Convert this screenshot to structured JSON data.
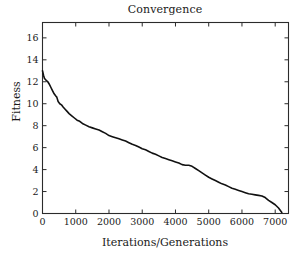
{
  "chart_data": {
    "type": "line",
    "title": "Convergence",
    "xlabel": "Iterations/Generations",
    "ylabel": "Fitness",
    "xlim": [
      0,
      7400
    ],
    "ylim": [
      0,
      17.4
    ],
    "grid": false,
    "legend": null,
    "xticks": [
      0,
      1000,
      2000,
      3000,
      4000,
      5000,
      6000,
      7000
    ],
    "xticklabels": [
      "0",
      "1000",
      "2000",
      "3000",
      "4000",
      "5000",
      "6000",
      "7000"
    ],
    "yticks": [
      0,
      2,
      4,
      6,
      8,
      10,
      12,
      14,
      16
    ],
    "yticklabels": [
      "0",
      "2",
      "4",
      "6",
      "8",
      "10",
      "12",
      "14",
      "16"
    ],
    "line_color": "#111111",
    "series": [
      {
        "name": "Best fitness",
        "x": [
          0,
          30,
          60,
          90,
          120,
          160,
          200,
          250,
          300,
          350,
          400,
          430,
          470,
          520,
          570,
          620,
          680,
          740,
          800,
          880,
          960,
          1040,
          1120,
          1200,
          1300,
          1400,
          1500,
          1600,
          1700,
          1800,
          1900,
          2000,
          2100,
          2200,
          2300,
          2400,
          2500,
          2600,
          2700,
          2800,
          2900,
          3000,
          3100,
          3200,
          3300,
          3400,
          3500,
          3600,
          3700,
          3800,
          3900,
          4000,
          4100,
          4200,
          4300,
          4400,
          4500,
          4600,
          4700,
          4800,
          4900,
          5000,
          5100,
          5200,
          5300,
          5400,
          5500,
          5600,
          5700,
          5800,
          5900,
          6000,
          6100,
          6200,
          6300,
          6400,
          6500,
          6600,
          6700,
          6800,
          6900,
          7000,
          7100,
          7200
        ],
        "y": [
          13.0,
          12.6,
          12.3,
          12.2,
          12.1,
          12.0,
          11.8,
          11.5,
          11.2,
          10.9,
          10.7,
          10.6,
          10.2,
          10.0,
          9.9,
          9.7,
          9.5,
          9.3,
          9.1,
          8.9,
          8.7,
          8.5,
          8.4,
          8.2,
          8.05,
          7.9,
          7.8,
          7.7,
          7.6,
          7.45,
          7.3,
          7.1,
          7.0,
          6.9,
          6.8,
          6.7,
          6.6,
          6.45,
          6.3,
          6.2,
          6.05,
          5.9,
          5.8,
          5.65,
          5.5,
          5.4,
          5.25,
          5.1,
          5.0,
          4.9,
          4.8,
          4.7,
          4.6,
          4.45,
          4.4,
          4.4,
          4.3,
          4.1,
          3.9,
          3.7,
          3.5,
          3.3,
          3.15,
          3.0,
          2.85,
          2.7,
          2.6,
          2.45,
          2.3,
          2.2,
          2.1,
          2.0,
          1.9,
          1.8,
          1.75,
          1.7,
          1.65,
          1.6,
          1.45,
          1.2,
          1.0,
          0.8,
          0.5,
          0.1
        ]
      }
    ]
  }
}
